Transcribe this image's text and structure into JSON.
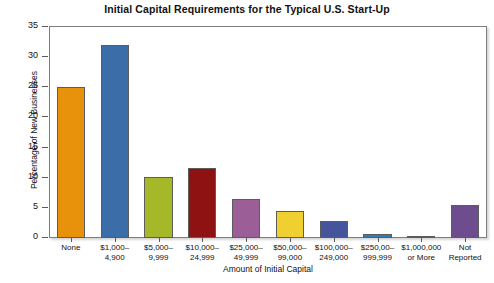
{
  "chart_data": {
    "type": "bar",
    "title": "Initial Capital Requirements for the Typical U.S. Start-Up",
    "xlabel": "Amount of Initial Capital",
    "ylabel": "Percentage of New Businesses",
    "categories": [
      "None",
      "$1,000–\n4,900",
      "$5,000–\n9,999",
      "$10,000–\n24,999",
      "$25,000–\n49,999",
      "$50,000–\n99,000",
      "$100,000–\n249,000",
      "$250,00–\n999,999",
      "$1,000,000\nor More",
      "Not\nReported"
    ],
    "values": [
      25.0,
      32.0,
      10.1,
      11.6,
      6.5,
      4.4,
      2.9,
      0.6,
      0.3,
      5.4
    ],
    "colors": [
      "#E8920C",
      "#3B6DA8",
      "#A5B827",
      "#8E1212",
      "#9B5E96",
      "#F0D030",
      "#45559B",
      "#2E7CB8",
      "#9E3418",
      "#6E4D8E"
    ],
    "ylim": [
      0,
      35
    ],
    "yticks": [
      0,
      5,
      10,
      15,
      20,
      25,
      30,
      35
    ],
    "ytick_labels": [
      "0",
      "5",
      "10",
      "15",
      "20",
      "25",
      "30",
      "35"
    ],
    "grid": false,
    "legend": "none",
    "bar_edge_color": "#5c5c5c",
    "axis_color": "#7d7d7d"
  }
}
